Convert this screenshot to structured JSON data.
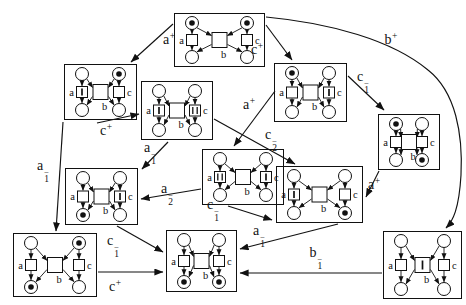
{
  "figure": {
    "kind": "petri-net-label-splitting-diagram",
    "background": "#ffffff",
    "ink": "#111111",
    "minus_glyph": "−",
    "plus_glyph": "+"
  },
  "transition_labels": {
    "left": "a",
    "middle": "b",
    "right": "c"
  },
  "nodes": [
    {
      "id": "top",
      "x": 174,
      "y": 13,
      "w": 91,
      "h": 54,
      "marking": [
        "tl",
        "tr"
      ],
      "bars": {}
    },
    {
      "id": "r2a",
      "x": 64,
      "y": 64,
      "w": 73,
      "h": 56,
      "marking": [
        "tr"
      ],
      "bars": {
        "a": 1
      }
    },
    {
      "id": "r2b",
      "x": 141,
      "y": 81,
      "w": 72,
      "h": 59,
      "marking": [],
      "bars": {
        "a": 1,
        "c": 2
      }
    },
    {
      "id": "r2c",
      "x": 274,
      "y": 63,
      "w": 73,
      "h": 59,
      "marking": [
        "tl"
      ],
      "bars": {
        "c": 1
      }
    },
    {
      "id": "r2d",
      "x": 378,
      "y": 114,
      "w": 62,
      "h": 56,
      "marking": [
        "tl",
        "br"
      ],
      "bars": {}
    },
    {
      "id": "r3a",
      "x": 65,
      "y": 168,
      "w": 73,
      "h": 57,
      "marking": [
        "bl"
      ],
      "bars": {
        "c": 1
      }
    },
    {
      "id": "r3b",
      "x": 202,
      "y": 149,
      "w": 82,
      "h": 56,
      "marking": [],
      "bars": {
        "a": 2,
        "c": 1
      }
    },
    {
      "id": "r3c",
      "x": 276,
      "y": 166,
      "w": 87,
      "h": 57,
      "marking": [
        "br"
      ],
      "bars": {
        "a": 1
      }
    },
    {
      "id": "b1",
      "x": 13,
      "y": 233,
      "w": 84,
      "h": 64,
      "marking": [
        "tr",
        "bl"
      ],
      "bars": {}
    },
    {
      "id": "b2",
      "x": 166,
      "y": 230,
      "w": 71,
      "h": 62,
      "marking": [
        "bl",
        "br"
      ],
      "bars": {}
    },
    {
      "id": "b3",
      "x": 383,
      "y": 231,
      "w": 79,
      "h": 68,
      "marking": [],
      "bars": {
        "b": 1
      }
    }
  ],
  "edges": [
    {
      "from": "top",
      "to": "r2a",
      "x1": 173,
      "y1": 24,
      "x2": 131,
      "y2": 62,
      "label": {
        "base": "a",
        "sup": "+",
        "sub": ""
      },
      "lx": 169,
      "ly": 39
    },
    {
      "from": "top",
      "to": "r2c",
      "x1": 266,
      "y1": 25,
      "x2": 292,
      "y2": 60,
      "label": {
        "base": "c",
        "sup": "+",
        "sub": ""
      },
      "lx": 257,
      "ly": 49
    },
    {
      "from": "top",
      "to": "b3",
      "path": "M 266,17 C 330,23 392,40 428,70 C 456,92 463,135 461,175 C 459,209 453,221 446,228",
      "label": {
        "base": "b",
        "sup": "+",
        "sub": ""
      },
      "lx": 391,
      "ly": 39
    },
    {
      "from": "r2c",
      "to": "r2d",
      "x1": 348,
      "y1": 76,
      "x2": 384,
      "y2": 110,
      "label": {
        "base": "c",
        "sup": "−",
        "sub": "1"
      },
      "lx": 363,
      "ly": 82
    },
    {
      "from": "r2c",
      "to": "r3b",
      "x1": 275,
      "y1": 91,
      "x2": 234,
      "y2": 146,
      "label": {
        "base": "a",
        "sup": "+",
        "sub": ""
      },
      "lx": 249,
      "ly": 104
    },
    {
      "from": "r2b",
      "to": "r3c",
      "x1": 214,
      "y1": 119,
      "x2": 295,
      "y2": 164,
      "label": {
        "base": "c",
        "sup": "−",
        "sub": "2"
      },
      "lx": 271,
      "ly": 140
    },
    {
      "from": "r2a",
      "to": "r2b",
      "x1": 97,
      "y1": 123,
      "x2": 139,
      "y2": 114,
      "label": {
        "base": "c",
        "sup": "+",
        "sub": ""
      },
      "lx": 106,
      "ly": 130
    },
    {
      "from": "r2a",
      "to": "b1",
      "x1": 63,
      "y1": 122,
      "x2": 56,
      "y2": 231,
      "label": {
        "base": "a",
        "sup": "−",
        "sub": "1"
      },
      "lx": 43,
      "ly": 171
    },
    {
      "from": "r2b",
      "to": "r3a",
      "x1": 168,
      "y1": 142,
      "x2": 142,
      "y2": 169,
      "label": {
        "base": "a",
        "sup": "−",
        "sub": "1"
      },
      "lx": 150,
      "ly": 153
    },
    {
      "from": "r3b",
      "to": "r3a",
      "x1": 201,
      "y1": 189,
      "x2": 141,
      "y2": 199,
      "label": {
        "base": "a",
        "sup": "−",
        "sub": "2"
      },
      "lx": 167,
      "ly": 194
    },
    {
      "from": "r3b",
      "to": "r3c",
      "x1": 228,
      "y1": 206,
      "x2": 272,
      "y2": 220,
      "label": {
        "base": "c",
        "sup": "−",
        "sub": "1"
      },
      "lx": 213,
      "ly": 210
    },
    {
      "from": "r3a",
      "to": "b2",
      "x1": 117,
      "y1": 226,
      "x2": 163,
      "y2": 252,
      "label": {
        "base": "c",
        "sup": "−",
        "sub": "1"
      },
      "lx": 113,
      "ly": 246
    },
    {
      "from": "b1",
      "to": "b2",
      "x1": 98,
      "y1": 272,
      "x2": 163,
      "y2": 272,
      "label": {
        "base": "c",
        "sup": "+",
        "sub": ""
      },
      "lx": 115,
      "ly": 286
    },
    {
      "from": "r3c",
      "to": "b2",
      "x1": 338,
      "y1": 224,
      "x2": 240,
      "y2": 249,
      "label": {
        "base": "a",
        "sup": "−",
        "sub": "1"
      },
      "lx": 259,
      "ly": 236
    },
    {
      "from": "b3",
      "to": "b2",
      "x1": 382,
      "y1": 273,
      "x2": 240,
      "y2": 273,
      "label": {
        "base": "b",
        "sup": "−",
        "sub": "1"
      },
      "lx": 316,
      "ly": 258
    },
    {
      "from": "r2d",
      "to": "r3c",
      "x1": 379,
      "y1": 171,
      "x2": 366,
      "y2": 197,
      "label": {
        "base": "a",
        "sup": "+",
        "sub": ""
      },
      "lx": 374,
      "ly": 184
    }
  ]
}
